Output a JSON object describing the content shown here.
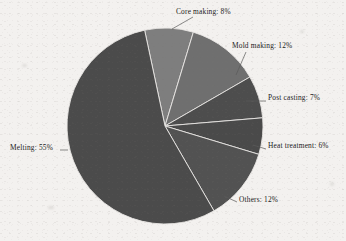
{
  "chart_data": {
    "type": "pie",
    "title": "",
    "subtitle": "",
    "xlabel": "",
    "ylabel": "",
    "legend_position": "outside-labels",
    "grid": false,
    "label_format": "{name}: {value}%",
    "total": 100,
    "categories": [
      "Core making",
      "Mold making",
      "Post casting",
      "Heat treatment",
      "Others",
      "Melting"
    ],
    "values": [
      8,
      12,
      7,
      6,
      12,
      55
    ],
    "start_angle_deg": -12,
    "direction": "clockwise",
    "slices": [
      {
        "name": "Core making",
        "value": 8,
        "label": "Core making: 8%",
        "color": "#7e7e7e",
        "start_deg": -12,
        "end_deg": 16.8
      },
      {
        "name": "Mold making",
        "value": 12,
        "label": "Mold making: 12%",
        "color": "#6f6f6f",
        "start_deg": 16.8,
        "end_deg": 60.0
      },
      {
        "name": "Post casting",
        "value": 7,
        "label": "Post casting: 7%",
        "color": "#4d4d4d",
        "start_deg": 60.0,
        "end_deg": 85.2
      },
      {
        "name": "Heat treatment",
        "value": 6,
        "label": "Heat treatment: 6%",
        "color": "#4a4a4a",
        "start_deg": 85.2,
        "end_deg": 106.8
      },
      {
        "name": "Others",
        "value": 12,
        "label": "Others: 12%",
        "color": "#525252",
        "start_deg": 106.8,
        "end_deg": 150.0
      },
      {
        "name": "Melting",
        "value": 55,
        "label": "Melting: 55%",
        "color": "#4b4b4b",
        "start_deg": 150.0,
        "end_deg": 348.0
      }
    ],
    "geometry": {
      "center_x": 165,
      "center_y": 126,
      "radius": 98,
      "separator_color": "#e9e7e4",
      "separator_width": 0.9
    },
    "leader_lines": [
      {
        "name": "Core making",
        "x1": 172,
        "y1": 29,
        "x2": 193,
        "y2": 17
      },
      {
        "name": "Mold making",
        "x1": 236,
        "y1": 75,
        "x2": 246,
        "y2": 52
      },
      {
        "name": "Post casting",
        "x1": 246,
        "y1": 101,
        "x2": 266,
        "y2": 101
      },
      {
        "name": "Heat treatment",
        "x1": 253,
        "y1": 145,
        "x2": 266,
        "y2": 149
      },
      {
        "name": "Others",
        "x1": 224,
        "y1": 196,
        "x2": 237,
        "y2": 202
      },
      {
        "name": "Melting",
        "x1": 68,
        "y1": 150,
        "x2": 60,
        "y2": 150
      }
    ]
  },
  "page": {
    "background_color": "#f3f1ef",
    "text_color": "#1b1b1b"
  }
}
